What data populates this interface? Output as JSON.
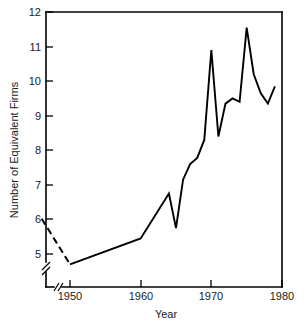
{
  "chart_data": {
    "type": "line",
    "title": "",
    "xlabel": "Year",
    "ylabel": "Number of Equivalent Firms",
    "xlim": [
      1946,
      1980
    ],
    "ylim": [
      4.5,
      12
    ],
    "grid": false,
    "legend": "none",
    "axis_break_x": true,
    "axis_break_y": true,
    "xticks": [
      1950,
      1960,
      1970,
      1980
    ],
    "xtick_labels": [
      "1950",
      "1960",
      "1970",
      "1980"
    ],
    "yticks": [
      5,
      6,
      7,
      8,
      9,
      10,
      11,
      12
    ],
    "ytick_labels": [
      "5",
      "6",
      "7",
      "8",
      "9",
      "10",
      "11",
      "12"
    ],
    "series": [
      {
        "name": "Number of Equivalent Firms",
        "style": "dashed",
        "x": [
          1946,
          1950
        ],
        "values": [
          6.02,
          4.7
        ]
      },
      {
        "name": "Number of Equivalent Firms",
        "style": "solid",
        "x": [
          1950,
          1960,
          1964,
          1965,
          1966,
          1967,
          1968,
          1969,
          1970,
          1971,
          1972,
          1973,
          1974,
          1975,
          1976,
          1977,
          1978,
          1979
        ],
        "values": [
          4.7,
          5.45,
          6.75,
          5.75,
          7.15,
          7.6,
          7.78,
          8.3,
          10.9,
          8.4,
          9.35,
          9.5,
          9.4,
          11.55,
          10.2,
          9.65,
          9.35,
          9.85
        ]
      }
    ]
  },
  "axis": {
    "y_title": "Number of Equivalent Firms",
    "x_title": "Year",
    "ytick_5": "5",
    "ytick_6": "6",
    "ytick_7": "7",
    "ytick_8": "8",
    "ytick_9": "9",
    "ytick_10": "10",
    "ytick_11": "11",
    "ytick_12": "12",
    "xtick_1950": "1950",
    "xtick_1960": "1960",
    "xtick_1970": "1970",
    "xtick_1980": "1980"
  },
  "colors": {
    "line": "#000000",
    "axis": "#000000",
    "background": "#ffffff"
  }
}
